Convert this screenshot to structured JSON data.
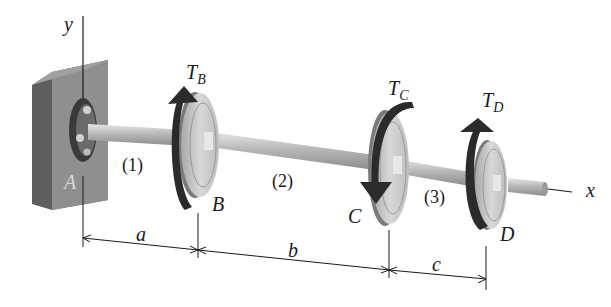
{
  "diagram": {
    "type": "torsion-shaft",
    "axes": {
      "y_label": "y",
      "x_label": "x"
    },
    "support": {
      "label": "A"
    },
    "segments": [
      {
        "label": "(1)"
      },
      {
        "label": "(2)"
      },
      {
        "label": "(3)"
      }
    ],
    "gears": [
      {
        "point": "B",
        "torque_symbol": "T",
        "torque_sub": "B",
        "direction": "up"
      },
      {
        "point": "C",
        "torque_symbol": "T",
        "torque_sub": "C",
        "direction": "down"
      },
      {
        "point": "D",
        "torque_symbol": "T",
        "torque_sub": "D",
        "direction": "up"
      }
    ],
    "dimensions": [
      {
        "label": "a"
      },
      {
        "label": "b"
      },
      {
        "label": "c"
      }
    ],
    "colors": {
      "wall_front": "#8a8a8a",
      "wall_side": "#5e5e5e",
      "shaft": "#b5b5b5",
      "gear_face": "#cfcfcf",
      "arrow": "#2b2b2b",
      "line": "#1a1a1a"
    }
  }
}
